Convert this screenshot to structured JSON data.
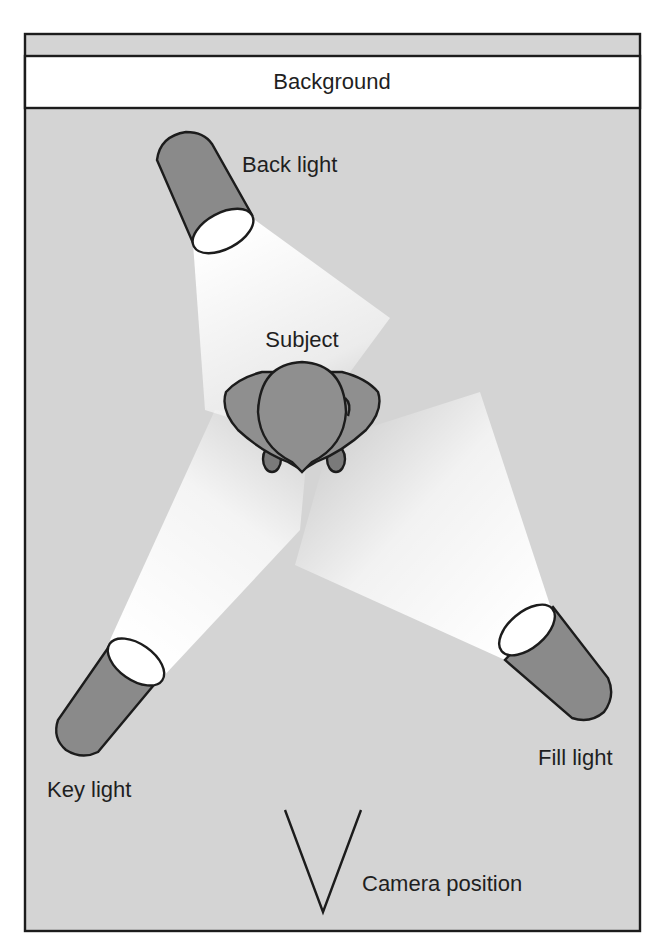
{
  "diagram": {
    "background_label": "Background",
    "subject_label": "Subject",
    "camera_label": "Camera position",
    "lights": [
      {
        "id": "back",
        "label": "Back light"
      },
      {
        "id": "key",
        "label": "Key light"
      },
      {
        "id": "fill",
        "label": "Fill light"
      }
    ],
    "colors": {
      "floor": "#d4d4d4",
      "backdrop_strip": "#ffffff",
      "light_body": "#8a8a8a",
      "light_lens": "#ffffff",
      "beam": "#ffffff",
      "subject": "#8f8f8f",
      "outline": "#1c1c1c"
    }
  }
}
